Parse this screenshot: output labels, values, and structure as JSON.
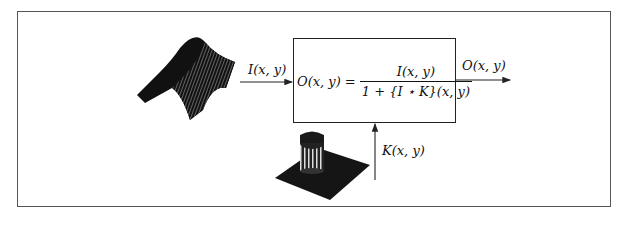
{
  "diagram": {
    "type": "block-diagram",
    "input_label": "I(x, y)",
    "output_label": "O(x, y)",
    "kernel_label": "K(x, y)",
    "equation": {
      "lhs": "O(x, y) =",
      "numerator": "I(x, y)",
      "denominator": "1 + {I ⋆ K}(x, y)"
    },
    "images": {
      "input_surface": "smooth-ridge-surface-plot",
      "kernel_surface": "cylinder-on-plane-surface-plot"
    },
    "colors": {
      "line": "#222222",
      "frame": "#555555",
      "surface": "#111111"
    }
  }
}
